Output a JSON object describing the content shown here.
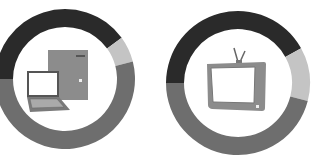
{
  "chart_data": [
    {
      "type": "pie",
      "variant": "donut",
      "title": "",
      "center_icon": "computer-icon",
      "start_angle_deg": 270,
      "categories": [
        "dark",
        "light",
        "medium"
      ],
      "values": [
        40,
        6,
        54
      ],
      "colors": [
        "#2a2a2a",
        "#c4c4c4",
        "#6e6e6e"
      ]
    },
    {
      "type": "pie",
      "variant": "donut",
      "title": "",
      "center_icon": "tv-icon",
      "start_angle_deg": 270,
      "categories": [
        "dark",
        "light",
        "medium"
      ],
      "values": [
        42,
        12,
        46
      ],
      "colors": [
        "#2a2a2a",
        "#c4c4c4",
        "#6e6e6e"
      ]
    }
  ],
  "charts": [
    {
      "cx": 65,
      "cy": 79,
      "r_outer": 70,
      "r_inner": 52
    },
    {
      "cx": 238,
      "cy": 83,
      "r_outer": 72,
      "r_inner": 54
    }
  ],
  "icon_colors": {
    "body": "#8c8c8c",
    "screen": "#ffffff",
    "dark": "#6a6a6a"
  }
}
